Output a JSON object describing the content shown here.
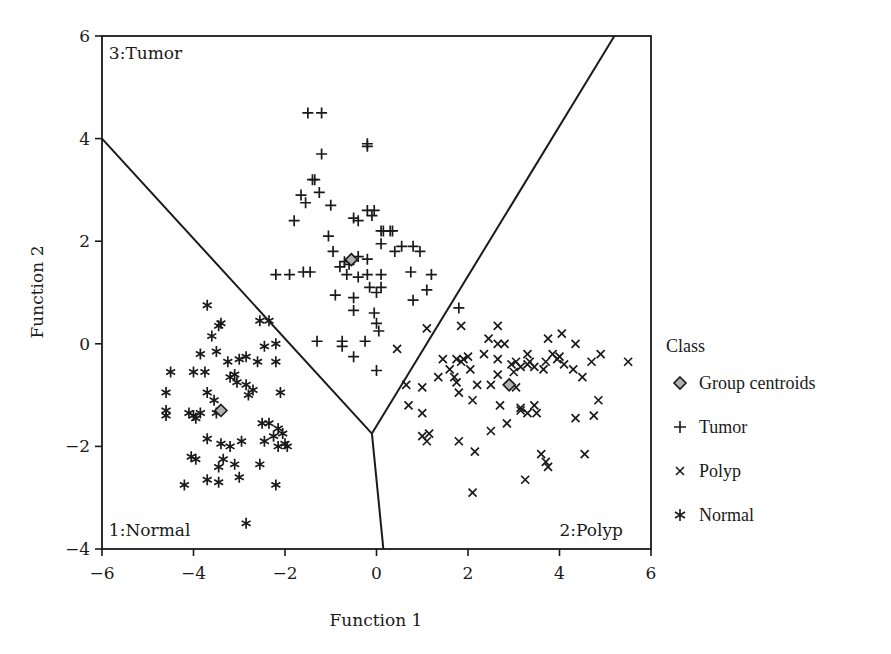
{
  "chart_data": {
    "type": "scatter",
    "title": "",
    "xlabel": "Function 1",
    "ylabel": "Function 2",
    "xlim": [
      -6,
      6
    ],
    "ylim": [
      -4,
      6
    ],
    "xticks": [
      -6,
      -4,
      -2,
      0,
      2,
      4,
      6
    ],
    "yticks": [
      -4,
      -2,
      0,
      2,
      4,
      6
    ],
    "xtick_labels": [
      "−6",
      "−4",
      "−2",
      "0",
      "2",
      "4",
      "6"
    ],
    "ytick_labels": [
      "−4",
      "−2",
      "0",
      "2",
      "4",
      "6"
    ],
    "grid": false,
    "legend_position": "right",
    "legend": {
      "title": "Class",
      "entries": [
        {
          "label": "Group centroids",
          "marker": "diamond"
        },
        {
          "label": "Tumor",
          "marker": "plus"
        },
        {
          "label": "Polyp",
          "marker": "x"
        },
        {
          "label": "Normal",
          "marker": "asterisk"
        }
      ]
    },
    "region_labels": [
      {
        "text": "3:Tumor",
        "x": -5.85,
        "y": 5.55
      },
      {
        "text": "1:Normal",
        "x": -5.85,
        "y": -3.75
      },
      {
        "text": "2:Polyp",
        "x": 4.0,
        "y": -3.75
      }
    ],
    "boundaries": [
      {
        "name": "tumor-normal",
        "points": [
          [
            -6.0,
            4.0
          ],
          [
            -0.1,
            -1.75
          ]
        ]
      },
      {
        "name": "tumor-polyp",
        "points": [
          [
            -0.1,
            -1.75
          ],
          [
            5.2,
            6.0
          ]
        ]
      },
      {
        "name": "normal-polyp",
        "points": [
          [
            -0.1,
            -1.75
          ],
          [
            0.15,
            -4.0
          ]
        ]
      }
    ],
    "centroids": [
      {
        "class": "Tumor",
        "x": -0.55,
        "y": 1.64
      },
      {
        "class": "Polyp",
        "x": 2.9,
        "y": -0.8
      },
      {
        "class": "Normal",
        "x": -3.4,
        "y": -1.3
      }
    ],
    "series": [
      {
        "name": "Tumor",
        "marker": "plus",
        "points": [
          [
            -1.5,
            4.5
          ],
          [
            -1.2,
            4.5
          ],
          [
            -1.2,
            3.7
          ],
          [
            -0.2,
            3.9
          ],
          [
            -0.2,
            3.85
          ],
          [
            -1.4,
            3.2
          ],
          [
            -1.35,
            3.2
          ],
          [
            -1.65,
            2.9
          ],
          [
            -1.55,
            2.75
          ],
          [
            -1.25,
            2.95
          ],
          [
            -1.0,
            2.7
          ],
          [
            -1.8,
            2.4
          ],
          [
            -0.4,
            2.4
          ],
          [
            -1.05,
            2.1
          ],
          [
            -0.2,
            2.6
          ],
          [
            -0.1,
            2.5
          ],
          [
            -0.05,
            2.6
          ],
          [
            0.15,
            2.2
          ],
          [
            0.3,
            2.2
          ],
          [
            0.35,
            2.2
          ],
          [
            -0.5,
            2.45
          ],
          [
            0.1,
            2.2
          ],
          [
            -0.7,
            1.6
          ],
          [
            -1.6,
            1.4
          ],
          [
            -1.9,
            1.35
          ],
          [
            -2.2,
            1.35
          ],
          [
            -1.45,
            1.4
          ],
          [
            -0.8,
            1.5
          ],
          [
            -0.6,
            1.55
          ],
          [
            -0.4,
            1.7
          ],
          [
            -0.65,
            1.35
          ],
          [
            0.1,
            1.95
          ],
          [
            0.1,
            1.35
          ],
          [
            0.55,
            1.9
          ],
          [
            0.8,
            1.9
          ],
          [
            0.95,
            1.8
          ],
          [
            0.75,
            1.4
          ],
          [
            1.2,
            1.35
          ],
          [
            1.1,
            1.05
          ],
          [
            0.8,
            0.85
          ],
          [
            0.0,
            1.0
          ],
          [
            -0.9,
            0.95
          ],
          [
            -0.5,
            0.9
          ],
          [
            -0.5,
            0.65
          ],
          [
            -0.05,
            0.6
          ],
          [
            0.0,
            0.4
          ],
          [
            0.05,
            0.25
          ],
          [
            -1.3,
            0.05
          ],
          [
            -0.75,
            0.05
          ],
          [
            -0.75,
            -0.05
          ],
          [
            -0.25,
            0.05
          ],
          [
            -0.5,
            -0.25
          ],
          [
            0.0,
            -0.52
          ],
          [
            -0.2,
            1.65
          ],
          [
            -0.4,
            1.3
          ],
          [
            -0.95,
            1.8
          ],
          [
            0.1,
            1.1
          ],
          [
            -0.15,
            1.1
          ],
          [
            0.4,
            1.8
          ],
          [
            -0.2,
            1.35
          ],
          [
            1.8,
            0.7
          ]
        ]
      },
      {
        "name": "Polyp",
        "marker": "x",
        "points": [
          [
            1.1,
            0.3
          ],
          [
            0.45,
            -0.1
          ],
          [
            1.85,
            0.35
          ],
          [
            2.45,
            0.1
          ],
          [
            1.45,
            -0.3
          ],
          [
            1.75,
            -0.3
          ],
          [
            1.85,
            -0.35
          ],
          [
            1.9,
            -0.3
          ],
          [
            2.0,
            -0.25
          ],
          [
            2.35,
            -0.2
          ],
          [
            1.6,
            -0.5
          ],
          [
            1.7,
            -0.65
          ],
          [
            2.05,
            -0.5
          ],
          [
            1.75,
            -0.75
          ],
          [
            1.35,
            -0.65
          ],
          [
            1.0,
            -0.85
          ],
          [
            1.8,
            -0.95
          ],
          [
            0.65,
            -0.8
          ],
          [
            0.7,
            -1.2
          ],
          [
            1.0,
            -1.35
          ],
          [
            2.5,
            -0.8
          ],
          [
            3.05,
            -0.85
          ],
          [
            2.1,
            -1.1
          ],
          [
            2.7,
            -1.2
          ],
          [
            1.0,
            -1.8
          ],
          [
            1.15,
            -1.75
          ],
          [
            1.1,
            -1.9
          ],
          [
            1.8,
            -1.9
          ],
          [
            2.5,
            -1.7
          ],
          [
            2.65,
            -0.6
          ],
          [
            2.15,
            -2.1
          ],
          [
            2.1,
            -2.9
          ],
          [
            2.65,
            0.35
          ],
          [
            2.65,
            0.0
          ],
          [
            2.65,
            -0.3
          ],
          [
            2.8,
            0.0
          ],
          [
            2.95,
            -0.4
          ],
          [
            3.0,
            -0.55
          ],
          [
            3.15,
            -0.45
          ],
          [
            3.3,
            -0.2
          ],
          [
            3.35,
            -0.35
          ],
          [
            3.45,
            -0.45
          ],
          [
            3.7,
            -0.35
          ],
          [
            3.85,
            -0.2
          ],
          [
            3.95,
            -0.3
          ],
          [
            4.0,
            -0.25
          ],
          [
            4.1,
            -0.4
          ],
          [
            4.3,
            -0.5
          ],
          [
            4.35,
            0.0
          ],
          [
            4.05,
            0.2
          ],
          [
            3.75,
            0.1
          ],
          [
            4.5,
            -0.65
          ],
          [
            4.7,
            -0.35
          ],
          [
            4.9,
            -0.2
          ],
          [
            5.5,
            -0.35
          ],
          [
            4.85,
            -1.1
          ],
          [
            4.75,
            -1.4
          ],
          [
            3.5,
            -1.35
          ],
          [
            3.15,
            -1.3
          ],
          [
            3.3,
            -1.35
          ],
          [
            3.45,
            -1.2
          ],
          [
            4.35,
            -1.45
          ],
          [
            3.15,
            -1.25
          ],
          [
            3.6,
            -2.15
          ],
          [
            3.75,
            -2.4
          ],
          [
            3.7,
            -2.3
          ],
          [
            4.55,
            -2.15
          ],
          [
            3.25,
            -2.65
          ],
          [
            2.85,
            -1.55
          ],
          [
            3.65,
            -0.5
          ],
          [
            3.3,
            -0.4
          ],
          [
            3.05,
            -0.35
          ],
          [
            2.2,
            -0.8
          ]
        ]
      },
      {
        "name": "Normal",
        "marker": "asterisk",
        "points": [
          [
            -3.7,
            0.75
          ],
          [
            -3.4,
            0.4
          ],
          [
            -3.45,
            0.35
          ],
          [
            -3.6,
            0.15
          ],
          [
            -3.0,
            -0.3
          ],
          [
            -2.45,
            -0.05
          ],
          [
            -2.35,
            0.45
          ],
          [
            -2.55,
            0.45
          ],
          [
            -2.2,
            0.0
          ],
          [
            -3.85,
            -0.2
          ],
          [
            -3.5,
            -0.15
          ],
          [
            -3.75,
            -0.55
          ],
          [
            -4.0,
            -0.55
          ],
          [
            -3.25,
            -0.35
          ],
          [
            -2.85,
            -0.25
          ],
          [
            -2.6,
            -0.35
          ],
          [
            -2.2,
            -0.35
          ],
          [
            -4.5,
            -0.55
          ],
          [
            -3.2,
            -0.65
          ],
          [
            -3.05,
            -0.75
          ],
          [
            -3.1,
            -0.6
          ],
          [
            -2.85,
            -0.8
          ],
          [
            -2.7,
            -0.9
          ],
          [
            -3.7,
            -0.95
          ],
          [
            -4.6,
            -0.95
          ],
          [
            -3.55,
            -1.1
          ],
          [
            -2.8,
            -1.0
          ],
          [
            -2.1,
            -0.95
          ],
          [
            -4.6,
            -1.4
          ],
          [
            -4.6,
            -1.3
          ],
          [
            -4.1,
            -1.35
          ],
          [
            -4.0,
            -1.4
          ],
          [
            -3.95,
            -1.45
          ],
          [
            -3.85,
            -1.35
          ],
          [
            -3.5,
            -1.35
          ],
          [
            -2.5,
            -1.55
          ],
          [
            -2.35,
            -1.55
          ],
          [
            -2.15,
            -1.65
          ],
          [
            -2.05,
            -1.75
          ],
          [
            -2.25,
            -1.8
          ],
          [
            -3.7,
            -1.85
          ],
          [
            -3.4,
            -1.95
          ],
          [
            -3.2,
            -2.0
          ],
          [
            -2.95,
            -1.9
          ],
          [
            -2.45,
            -1.9
          ],
          [
            -3.45,
            -2.4
          ],
          [
            -3.35,
            -2.25
          ],
          [
            -3.1,
            -2.35
          ],
          [
            -2.55,
            -2.35
          ],
          [
            -2.15,
            -2.0
          ],
          [
            -3.95,
            -2.25
          ],
          [
            -4.05,
            -2.2
          ],
          [
            -3.7,
            -2.65
          ],
          [
            -3.45,
            -2.7
          ],
          [
            -3.0,
            -2.6
          ],
          [
            -2.2,
            -2.75
          ],
          [
            -4.2,
            -2.75
          ],
          [
            -2.85,
            -3.5
          ],
          [
            -1.95,
            -2.0
          ],
          [
            -2.0,
            -1.95
          ]
        ]
      }
    ]
  },
  "legend": {
    "title": "Class",
    "items": [
      {
        "label": "Group centroids"
      },
      {
        "label": "Tumor"
      },
      {
        "label": "Polyp"
      },
      {
        "label": "Normal"
      }
    ]
  },
  "axes": {
    "x_title": "Function 1",
    "y_title": "Function 2"
  },
  "colors": {
    "ink": "#1a1a1a",
    "centroid_fill": "#b0b0b0",
    "background": "#ffffff"
  }
}
